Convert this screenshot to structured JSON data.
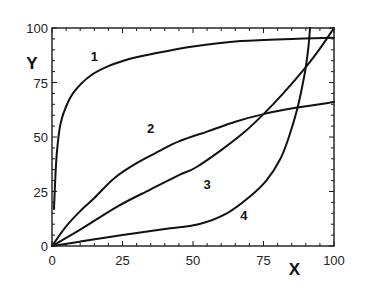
{
  "chart_data": {
    "type": "line",
    "title": "",
    "xlabel": "X",
    "ylabel": "Y",
    "xlim": [
      0,
      100
    ],
    "ylim": [
      0,
      100
    ],
    "grid": false,
    "legend": "none (curves labeled inline)",
    "x_ticks": [
      0,
      25,
      50,
      75,
      100
    ],
    "y_ticks": [
      0,
      25,
      50,
      75,
      100
    ],
    "x_tick_labels": [
      "0",
      "25",
      "50",
      "75",
      "100"
    ],
    "y_tick_labels": [
      "0",
      "25",
      "50",
      "75",
      "100"
    ],
    "minor_tick_step": 5,
    "series": [
      {
        "name": "1",
        "label": "1",
        "label_at": [
          15,
          85
        ],
        "points": [
          [
            0.7,
            17
          ],
          [
            1.2,
            32
          ],
          [
            1.8,
            44
          ],
          [
            3,
            56
          ],
          [
            5,
            64
          ],
          [
            8,
            71
          ],
          [
            13.5,
            78
          ],
          [
            20,
            82.5
          ],
          [
            28,
            86
          ],
          [
            35,
            88
          ],
          [
            50,
            91.5
          ],
          [
            67,
            94
          ],
          [
            85,
            95
          ],
          [
            100,
            95.5
          ]
        ]
      },
      {
        "name": "2",
        "label": "2",
        "label_at": [
          35,
          52
        ],
        "points": [
          [
            0,
            0
          ],
          [
            5,
            9
          ],
          [
            10,
            16
          ],
          [
            15,
            22
          ],
          [
            22,
            31
          ],
          [
            30,
            38
          ],
          [
            38,
            43.5
          ],
          [
            45,
            48
          ],
          [
            55,
            52.5
          ],
          [
            65,
            57
          ],
          [
            75,
            60.5
          ],
          [
            87,
            63.5
          ],
          [
            100,
            66
          ]
        ]
      },
      {
        "name": "3",
        "label": "3",
        "label_at": [
          55,
          26
        ],
        "points": [
          [
            0,
            0
          ],
          [
            10,
            7.5
          ],
          [
            23,
            18
          ],
          [
            35,
            26
          ],
          [
            45,
            32.5
          ],
          [
            51,
            36
          ],
          [
            60,
            44
          ],
          [
            68,
            52
          ],
          [
            75,
            60.5
          ],
          [
            82,
            70
          ],
          [
            90,
            82
          ],
          [
            95,
            90.5
          ],
          [
            100,
            100
          ]
        ]
      },
      {
        "name": "4",
        "label": "4",
        "label_at": [
          68,
          12
        ],
        "points": [
          [
            0,
            0
          ],
          [
            10,
            2
          ],
          [
            25,
            5
          ],
          [
            40,
            7.8
          ],
          [
            52,
            10
          ],
          [
            62,
            15
          ],
          [
            70,
            22.5
          ],
          [
            76,
            30
          ],
          [
            81,
            40
          ],
          [
            84,
            50
          ],
          [
            87,
            63
          ],
          [
            89,
            75
          ],
          [
            90,
            82
          ],
          [
            91,
            92
          ],
          [
            91.5,
            100
          ]
        ]
      }
    ]
  }
}
